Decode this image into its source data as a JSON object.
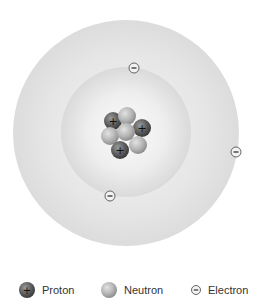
{
  "diagram": {
    "outer_shell": {
      "cx": 126,
      "cy": 133,
      "r": 113,
      "color": "#e4e4e4"
    },
    "inner_shell": {
      "cx": 126,
      "cy": 132,
      "r": 65,
      "color": "#e0e0e0"
    },
    "nucleus": {
      "particles": [
        {
          "type": "neutron",
          "x": 126,
          "y": 117
        },
        {
          "type": "proton",
          "x": 113,
          "y": 121
        },
        {
          "type": "proton",
          "x": 142,
          "y": 128
        },
        {
          "type": "neutron",
          "x": 110,
          "y": 136
        },
        {
          "type": "neutron",
          "x": 138,
          "y": 145
        },
        {
          "type": "proton",
          "x": 120,
          "y": 150
        },
        {
          "type": "neutron",
          "x": 126,
          "y": 131
        }
      ]
    },
    "electrons": [
      {
        "x": 134,
        "y": 68
      },
      {
        "x": 236,
        "y": 152
      },
      {
        "x": 110,
        "y": 196
      }
    ]
  },
  "legend": {
    "items": [
      {
        "icon": "proton-icon",
        "label": "Proton"
      },
      {
        "icon": "neutron-icon",
        "label": "Neutron"
      },
      {
        "icon": "electron-icon",
        "label": "Electron"
      }
    ]
  },
  "colors": {
    "proton": "#5a5a5a",
    "neutron": "#b8b8b8",
    "electron_fill": "#f2f2f2",
    "electron_stroke": "#555555"
  }
}
